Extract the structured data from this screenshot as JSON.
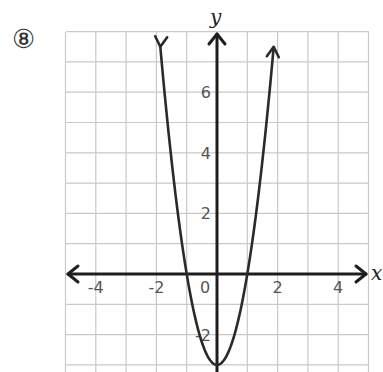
{
  "problem": {
    "number_label": "⑧"
  },
  "chart_data": {
    "type": "line",
    "title": "",
    "function": "y = 3x^2 - 3",
    "xlabel": "x",
    "ylabel": "y",
    "xlim": [
      -5,
      5
    ],
    "ylim": [
      -3,
      8
    ],
    "grid": true,
    "grid_step": 1,
    "x_ticks": [
      -4,
      -2,
      0,
      2,
      4
    ],
    "y_ticks": [
      -2,
      2,
      4,
      6
    ],
    "x_tick_labels": [
      "-4",
      "-2",
      "0",
      "2",
      "4"
    ],
    "y_tick_labels": [
      "-2",
      "2",
      "4",
      "6"
    ],
    "key_points": [
      {
        "x": -1,
        "y": 0,
        "label": "x-intercept"
      },
      {
        "x": 1,
        "y": 0,
        "label": "x-intercept"
      },
      {
        "x": 0,
        "y": -3,
        "label": "vertex"
      }
    ],
    "series": [
      {
        "name": "parabola",
        "x": [
          -1.87,
          -1.5,
          -1,
          -0.5,
          0,
          0.5,
          1,
          1.5,
          1.87
        ],
        "y": [
          7.5,
          3.75,
          0,
          -2.25,
          -3,
          -2.25,
          0,
          3.75,
          7.5
        ]
      }
    ],
    "curve_arrows": true,
    "legend": null
  }
}
